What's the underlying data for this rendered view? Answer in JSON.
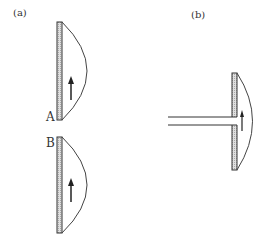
{
  "panels": {
    "a": {
      "label": "(a)",
      "plates": [
        {
          "label": "A"
        },
        {
          "label": "B"
        }
      ]
    },
    "b": {
      "label": "(b)"
    }
  },
  "colors": {
    "stroke": "#333333",
    "hatch": "#bbbbbb"
  }
}
